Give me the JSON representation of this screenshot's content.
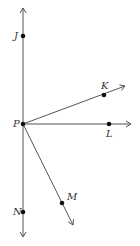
{
  "diagram": {
    "type": "rays-from-point",
    "origin": {
      "name": "P",
      "x": 23,
      "y": 124
    },
    "points": [
      {
        "name": "J",
        "x": 23,
        "y": 36,
        "label_dx": -9,
        "label_dy": 3
      },
      {
        "name": "P",
        "x": 23,
        "y": 124,
        "label_dx": -10,
        "label_dy": 3
      },
      {
        "name": "K",
        "x": 104,
        "y": 95,
        "label_dx": -3,
        "label_dy": -6
      },
      {
        "name": "L",
        "x": 109,
        "y": 124,
        "label_dx": -3,
        "label_dy": 13
      },
      {
        "name": "M",
        "x": 62,
        "y": 203,
        "label_dx": 5,
        "label_dy": -3
      },
      {
        "name": "N",
        "x": 23,
        "y": 212,
        "label_dx": -10,
        "label_dy": 3
      }
    ],
    "lines": [
      {
        "name": "line-JN",
        "x1": 23,
        "y1": 8,
        "x2": 23,
        "y2": 237,
        "arrows": [
          "start",
          "end"
        ]
      },
      {
        "name": "ray-PK",
        "x1": 23,
        "y1": 124,
        "x2": 125,
        "y2": 86,
        "arrows": [
          "end"
        ]
      },
      {
        "name": "ray-PL",
        "x1": 23,
        "y1": 124,
        "x2": 131,
        "y2": 124,
        "arrows": [
          "end"
        ]
      },
      {
        "name": "ray-PM",
        "x1": 23,
        "y1": 124,
        "x2": 73,
        "y2": 225,
        "arrows": [
          "end"
        ]
      }
    ],
    "colors": {
      "line": "#555555",
      "point": "#111111",
      "label": "#333333"
    }
  },
  "labels": {
    "J": "J",
    "P": "P",
    "K": "K",
    "L": "L",
    "M": "M",
    "N": "N"
  }
}
